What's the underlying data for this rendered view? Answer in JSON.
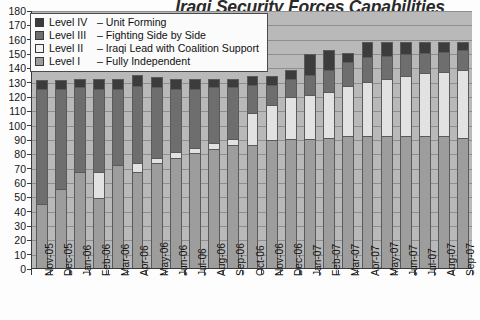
{
  "chart_data": {
    "type": "bar",
    "subtype": "stacked-column",
    "title": "Iraqi Security Forces Capabilities",
    "xlabel": "",
    "ylabel": "",
    "ylim": [
      0,
      180
    ],
    "ytick_step": 10,
    "grid": true,
    "legend_position": "top-left",
    "yticks": [
      180,
      170,
      160,
      150,
      140,
      130,
      120,
      110,
      100,
      90,
      80,
      70,
      60,
      50,
      40,
      30,
      20,
      10,
      0
    ],
    "categories": [
      "Nov-05",
      "Dec-05",
      "Jan-06",
      "Feb-06",
      "Mar-06",
      "Apr-06",
      "May-06",
      "Jun-06",
      "Jul-06",
      "Aug-06",
      "Sep-06",
      "Oct-06",
      "Nov-06",
      "Dec-06",
      "Jan-07",
      "Feb-07",
      "Mar-07",
      "Apr-07",
      "May-07",
      "Jun-07",
      "Jul-07",
      "Aug-07",
      "Sep-07"
    ],
    "series": [
      {
        "name": "Level I  – Fully Independent",
        "short": "Level I",
        "color": "#9d9d9d",
        "values": [
          45,
          55,
          67,
          49,
          72,
          67,
          73,
          77,
          80,
          83,
          86,
          86,
          89,
          90,
          90,
          91,
          92,
          92,
          92,
          92,
          92,
          92,
          91
        ]
      },
      {
        "name": "Level II  – Iraqi Lead with Coalition Support",
        "short": "Level II",
        "color": "#e2e2e2",
        "values": [
          0,
          0,
          0,
          18,
          0,
          6,
          4,
          4,
          4,
          4,
          4,
          22,
          25,
          29,
          31,
          32,
          35,
          38,
          40,
          42,
          44,
          45,
          47
        ]
      },
      {
        "name": "Level III – Fighting Side by Side",
        "short": "Level III",
        "color": "#6e6e6e",
        "values": [
          80,
          70,
          59,
          58,
          53,
          54,
          49,
          44,
          41,
          39,
          36,
          20,
          14,
          13,
          14,
          15,
          17,
          17,
          16,
          15,
          14,
          14,
          14
        ]
      },
      {
        "name": "Level IV – Unit Forming",
        "short": "Level IV",
        "color": "#3c3c3c",
        "values": [
          6,
          6,
          6,
          7,
          7,
          8,
          7,
          7,
          7,
          6,
          6,
          6,
          6,
          6,
          14,
          14,
          6,
          11,
          10,
          9,
          8,
          7,
          6
        ]
      }
    ],
    "totals": [
      131,
      131,
      132,
      132,
      132,
      135,
      133,
      132,
      132,
      132,
      132,
      134,
      134,
      138,
      149,
      152,
      150,
      158,
      158,
      158,
      158,
      158,
      158
    ]
  },
  "legend": {
    "items": [
      {
        "level": "Level IV",
        "dash": "–",
        "desc": "Unit Forming"
      },
      {
        "level": "Level III",
        "dash": "–",
        "desc": "Fighting Side by Side"
      },
      {
        "level": "Level II ",
        "dash": "–",
        "desc": "Iraqi Lead with Coalition Support"
      },
      {
        "level": "Level I ",
        "dash": "–",
        "desc": "Fully Independent"
      }
    ]
  },
  "colors": {
    "level1": "#9d9d9d",
    "level2": "#e2e2e2",
    "level3": "#6e6e6e",
    "level4": "#3c3c3c",
    "plot_background": "#b9b9b9",
    "gridline": "#8e8e8e",
    "axis": "#3a3a3a"
  }
}
